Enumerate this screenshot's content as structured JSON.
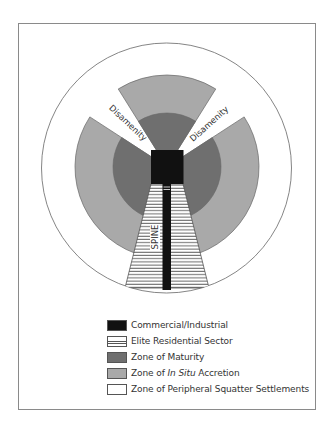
{
  "diagram": {
    "labels": {
      "disamenity_left": "Disamenity",
      "disamenity_right": "Disamenity",
      "spine": "SPINE"
    },
    "colors": {
      "commercial_industrial": "#111111",
      "elite_residential_fill": "#ffffff",
      "elite_residential_stripe": "#555555",
      "zone_of_maturity": "#6f6f6f",
      "zone_in_situ_accretion": "#a9a9a9",
      "zone_peripheral_squatter": "#ffffff",
      "outline": "#666666"
    },
    "zones": [
      {
        "id": "commercial-industrial",
        "name": "Commercial/Industrial"
      },
      {
        "id": "elite-residential",
        "name": "Elite Residential Sector"
      },
      {
        "id": "zone-of-maturity",
        "name": "Zone of Maturity"
      },
      {
        "id": "zone-in-situ-accretion",
        "name": "Zone of In Situ Accretion"
      },
      {
        "id": "zone-peripheral-squatter",
        "name": "Zone of Peripheral Squatter Settlements"
      }
    ]
  },
  "legend": {
    "items": [
      {
        "label": "Commercial/Industrial",
        "color": "#111111",
        "pattern": "solid"
      },
      {
        "label": "Elite Residential Sector",
        "color": "#ffffff",
        "pattern": "stripes"
      },
      {
        "label": "Zone of Maturity",
        "color": "#6f6f6f",
        "pattern": "solid"
      },
      {
        "label_prefix": "Zone of ",
        "label_italic": "In Situ",
        "label_suffix": " Accretion",
        "color": "#a9a9a9",
        "pattern": "solid"
      },
      {
        "label": "Zone of Peripheral Squatter Settlements",
        "color": "#ffffff",
        "pattern": "solid"
      }
    ]
  }
}
